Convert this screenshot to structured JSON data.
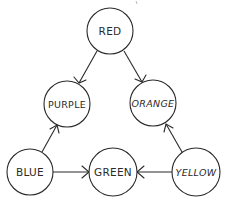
{
  "diagram": {
    "type": "directed-graph",
    "nodes": [
      {
        "id": "red",
        "label": "RED",
        "cx": 110,
        "cy": 31,
        "r": 23
      },
      {
        "id": "purple",
        "label": "PURPLE",
        "cx": 67,
        "cy": 104,
        "r": 23
      },
      {
        "id": "orange",
        "label": "ORANGE",
        "cx": 153,
        "cy": 103,
        "r": 23
      },
      {
        "id": "blue",
        "label": "BLUE",
        "cx": 30,
        "cy": 172,
        "r": 23
      },
      {
        "id": "green",
        "label": "GREEN",
        "cx": 113,
        "cy": 172,
        "r": 24
      },
      {
        "id": "yellow",
        "label": "YELLOW",
        "cx": 196,
        "cy": 172,
        "r": 24
      }
    ],
    "edges": [
      {
        "from": "red",
        "to": "purple"
      },
      {
        "from": "red",
        "to": "orange"
      },
      {
        "from": "blue",
        "to": "purple"
      },
      {
        "from": "yellow",
        "to": "orange"
      },
      {
        "from": "blue",
        "to": "green"
      },
      {
        "from": "yellow",
        "to": "green"
      }
    ]
  }
}
